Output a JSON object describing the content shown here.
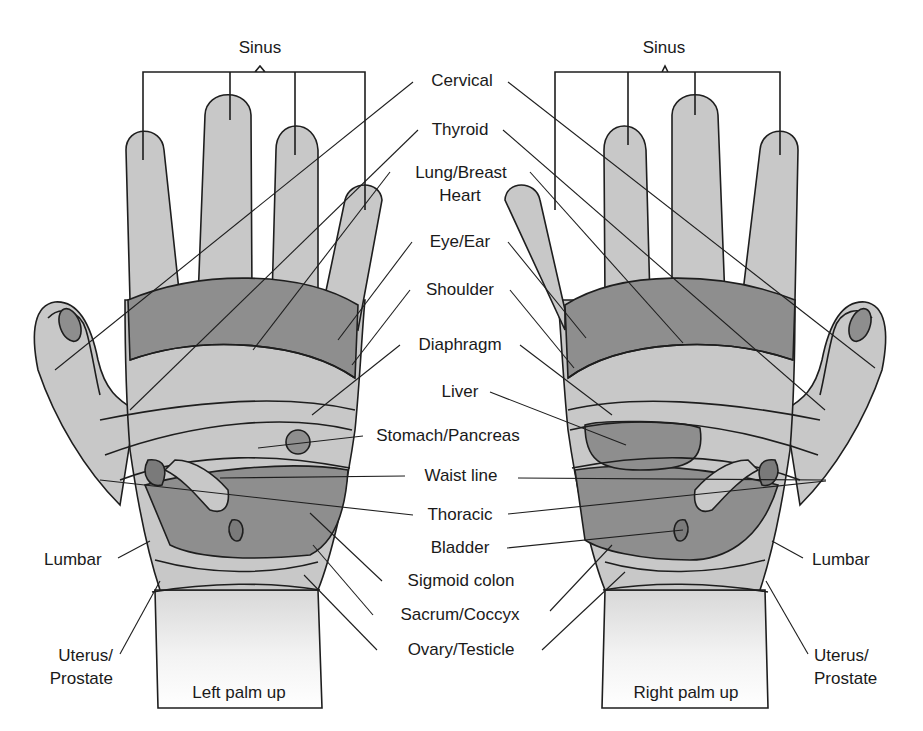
{
  "diagram": {
    "colors": {
      "skin_light": "#c8c8c8",
      "skin_mid": "#b0b0b0",
      "zone_dark": "#8e8e8e",
      "organ": "#7a7a7a",
      "wrist_fade": "#f2f2f2",
      "line": "#1e1e1e",
      "background": "#ffffff"
    },
    "hands": [
      {
        "id": "left",
        "caption": "Left palm up"
      },
      {
        "id": "right",
        "caption": "Right palm up"
      }
    ],
    "labels": {
      "sinus_left": "Sinus",
      "sinus_right": "Sinus",
      "cervical": "Cervical",
      "thyroid": "Thyroid",
      "lung_breast": "Lung/Breast",
      "heart": "Heart",
      "eye_ear": "Eye/Ear",
      "shoulder": "Shoulder",
      "diaphragm": "Diaphragm",
      "liver": "Liver",
      "stomach_pancreas": "Stomach/Pancreas",
      "waist_line": "Waist line",
      "thoracic": "Thoracic",
      "bladder": "Bladder",
      "sigmoid_colon": "Sigmoid colon",
      "sacrum_coccyx": "Sacrum/Coccyx",
      "ovary_testicle": "Ovary/Testicle",
      "lumbar_left": "Lumbar",
      "lumbar_right": "Lumbar",
      "uterus_prostate_left_1": "Uterus/",
      "uterus_prostate_left_2": "Prostate",
      "uterus_prostate_right_1": "Uterus/",
      "uterus_prostate_right_2": "Prostate"
    }
  }
}
